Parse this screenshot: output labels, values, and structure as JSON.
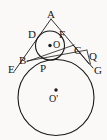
{
  "figure": {
    "canvas": {
      "width": 107,
      "height": 140
    },
    "colors": {
      "background": "#faf9f7",
      "stroke": "#1a1a1a",
      "label": "#161616"
    },
    "labels": {
      "apex": "A",
      "small_circle_left_tangent": "D",
      "small_circle_right_tangent": "F",
      "small_circle_center": "O",
      "point_on_left_side": "B",
      "point_right_inner": "C",
      "point_outer_right": "Q",
      "left_base_vertex": "E",
      "tangency_top": "P",
      "right_base_vertex": "G",
      "large_circle_center": "O'"
    },
    "label_positions": {
      "apex": {
        "x": 47,
        "y": 9
      },
      "small_circle_left_tangent": {
        "x": 28,
        "y": 29
      },
      "small_circle_right_tangent": {
        "x": 60,
        "y": 29
      },
      "small_circle_center": {
        "x": 53,
        "y": 40
      },
      "point_on_left_side": {
        "x": 20,
        "y": 56
      },
      "point_right_inner": {
        "x": 74,
        "y": 46
      },
      "point_outer_right": {
        "x": 89,
        "y": 51
      },
      "left_base_vertex": {
        "x": 9,
        "y": 64
      },
      "tangency_top": {
        "x": 41,
        "y": 64
      },
      "right_base_vertex": {
        "x": 94,
        "y": 66
      },
      "large_circle_center": {
        "x": 50,
        "y": 96
      }
    },
    "shapes": {
      "small_circle": {
        "cx": 50,
        "cy": 45.5,
        "r": 14.5
      },
      "large_circle": {
        "cx": 56,
        "cy": 97.5,
        "r": 38
      },
      "small_center_dot": {
        "cx": 50,
        "cy": 45.5,
        "r": 1.6
      },
      "large_center_dot": {
        "cx": 56,
        "cy": 90,
        "r": 1.6
      }
    },
    "segments": [
      {
        "name": "side-AE",
        "x1": 51,
        "y1": 19,
        "x2": 14.5,
        "y2": 71
      },
      {
        "name": "side-AG",
        "x1": 51,
        "y1": 19,
        "x2": 93,
        "y2": 68
      },
      {
        "name": "chord-BQ",
        "x1": 27,
        "y1": 61,
        "x2": 88,
        "y2": 50
      },
      {
        "name": "chord-BC-lower",
        "x1": 27,
        "y1": 61,
        "x2": 75,
        "y2": 44
      },
      {
        "name": "line-CG",
        "x1": 73,
        "y1": 45,
        "x2": 88,
        "y2": 63
      },
      {
        "name": "line-QG",
        "x1": 88,
        "y1": 50,
        "x2": 90,
        "y2": 64
      }
    ]
  }
}
